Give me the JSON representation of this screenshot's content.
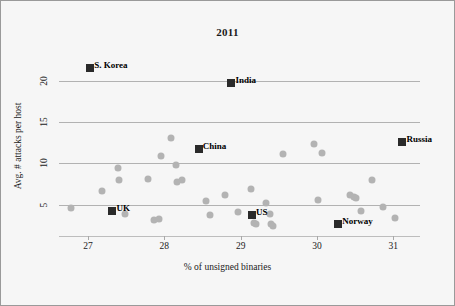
{
  "chart_data": {
    "type": "scatter",
    "title": "2011",
    "xlabel": "% of unsigned binaries",
    "ylabel": "Avg. # attacks per host",
    "xlim": [
      26.62,
      31.35
    ],
    "ylim": [
      1.2,
      23.0
    ],
    "xticks": [
      "27",
      "28",
      "29",
      "30",
      "31"
    ],
    "xtick_values": [
      27,
      28,
      29,
      30,
      31
    ],
    "yticks": [
      "5",
      "10",
      "15",
      "20"
    ],
    "ytick_values": [
      5,
      10,
      15,
      20
    ],
    "grid": "horizontal",
    "legend": "none",
    "series": [
      {
        "name": "highlighted-countries",
        "marker": "square",
        "color": "#2a2a2a",
        "points": [
          {
            "label": "S. Korea",
            "x": 27.03,
            "y": 21.6
          },
          {
            "label": "India",
            "x": 28.88,
            "y": 19.7
          },
          {
            "label": "China",
            "x": 28.45,
            "y": 11.7
          },
          {
            "label": "Russia",
            "x": 31.12,
            "y": 12.6
          },
          {
            "label": "UK",
            "x": 27.32,
            "y": 4.2
          },
          {
            "label": "US",
            "x": 29.15,
            "y": 3.7
          },
          {
            "label": "Norway",
            "x": 30.28,
            "y": 2.6
          }
        ]
      },
      {
        "name": "other-countries",
        "marker": "circle",
        "color": "#b3b3b3",
        "points": [
          {
            "x": 26.78,
            "y": 4.6
          },
          {
            "x": 27.18,
            "y": 6.7
          },
          {
            "x": 27.39,
            "y": 9.4
          },
          {
            "x": 27.4,
            "y": 8.0
          },
          {
            "x": 27.48,
            "y": 3.9
          },
          {
            "x": 27.78,
            "y": 8.1
          },
          {
            "x": 27.86,
            "y": 3.1
          },
          {
            "x": 27.93,
            "y": 3.2
          },
          {
            "x": 27.96,
            "y": 10.9
          },
          {
            "x": 28.09,
            "y": 13.1
          },
          {
            "x": 28.15,
            "y": 9.8
          },
          {
            "x": 28.16,
            "y": 7.8
          },
          {
            "x": 28.23,
            "y": 8.0
          },
          {
            "x": 28.55,
            "y": 5.4
          },
          {
            "x": 28.6,
            "y": 3.8
          },
          {
            "x": 28.79,
            "y": 6.2
          },
          {
            "x": 28.97,
            "y": 4.1
          },
          {
            "x": 29.13,
            "y": 6.9
          },
          {
            "x": 29.17,
            "y": 2.8
          },
          {
            "x": 29.2,
            "y": 2.6
          },
          {
            "x": 29.33,
            "y": 5.2
          },
          {
            "x": 29.38,
            "y": 3.9
          },
          {
            "x": 29.4,
            "y": 2.6
          },
          {
            "x": 29.43,
            "y": 2.4
          },
          {
            "x": 29.55,
            "y": 11.1
          },
          {
            "x": 29.96,
            "y": 12.3
          },
          {
            "x": 30.02,
            "y": 5.6
          },
          {
            "x": 30.06,
            "y": 11.2
          },
          {
            "x": 30.43,
            "y": 6.2
          },
          {
            "x": 30.48,
            "y": 5.9
          },
          {
            "x": 30.51,
            "y": 5.8
          },
          {
            "x": 30.58,
            "y": 4.2
          },
          {
            "x": 30.72,
            "y": 8.0
          },
          {
            "x": 30.86,
            "y": 4.7
          },
          {
            "x": 31.02,
            "y": 3.4
          }
        ]
      }
    ]
  }
}
